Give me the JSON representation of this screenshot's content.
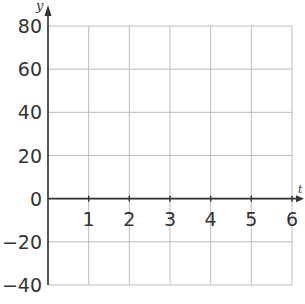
{
  "chart_data": {
    "type": "line",
    "title": "",
    "xlabel": "t",
    "ylabel": "y",
    "x_ticks": [
      1,
      2,
      3,
      4,
      5,
      6
    ],
    "y_ticks": [
      80,
      60,
      40,
      20,
      0,
      -20,
      -40
    ],
    "y_tick_labels": [
      "80",
      "60",
      "40",
      "20",
      "0",
      "−20",
      "−40"
    ],
    "xlim": [
      0,
      6
    ],
    "ylim": [
      -40,
      80
    ],
    "grid": true,
    "series": [],
    "colors": {
      "grid": "#bdbdbd",
      "axis": "#333333"
    }
  }
}
